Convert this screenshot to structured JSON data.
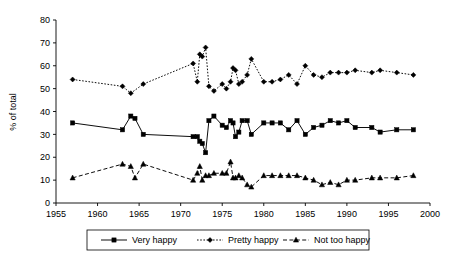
{
  "chart_data": {
    "type": "line",
    "title": "",
    "xlabel": "",
    "ylabel": "% of total",
    "xlim": [
      1955,
      2000
    ],
    "ylim": [
      0,
      80
    ],
    "xticks": [
      1955,
      1960,
      1965,
      1970,
      1975,
      1980,
      1985,
      1990,
      1995,
      2000
    ],
    "yticks": [
      0,
      10,
      20,
      30,
      40,
      50,
      60,
      70,
      80
    ],
    "grid": false,
    "legend_position": "bottom",
    "series": [
      {
        "name": "Very happy",
        "marker": "square",
        "line_style": "solid",
        "color": "#000000",
        "x": [
          1957,
          1963,
          1964,
          1964.5,
          1965.5,
          1971.5,
          1972,
          1972.3,
          1972.6,
          1973,
          1973.4,
          1974,
          1975,
          1975.5,
          1976,
          1976.3,
          1976.6,
          1977,
          1977.4,
          1978,
          1978.5,
          1980,
          1981,
          1982,
          1983,
          1984,
          1985,
          1986,
          1987,
          1988,
          1989,
          1990,
          1991,
          1993,
          1994,
          1996,
          1998
        ],
        "y": [
          35,
          32,
          38,
          37,
          30,
          29,
          29,
          27,
          26,
          22,
          36,
          38,
          34,
          33,
          36,
          35,
          29,
          31,
          36,
          36,
          30,
          35,
          35,
          35,
          32,
          36,
          30,
          33,
          34,
          36,
          35,
          36,
          33,
          33,
          31,
          32,
          32
        ]
      },
      {
        "name": "Pretty happy",
        "marker": "diamond",
        "line_style": "dotted",
        "color": "#000000",
        "x": [
          1957,
          1963,
          1964,
          1965.5,
          1971.5,
          1972,
          1972.3,
          1972.6,
          1973,
          1973.4,
          1974,
          1975,
          1975.5,
          1976,
          1976.3,
          1976.6,
          1977,
          1977.4,
          1978,
          1978.5,
          1980,
          1981,
          1982,
          1983,
          1984,
          1985,
          1986,
          1987,
          1988,
          1989,
          1990,
          1991,
          1993,
          1994,
          1996,
          1998
        ],
        "y": [
          54,
          51,
          48,
          52,
          61,
          53,
          65,
          64,
          68,
          51,
          49,
          52,
          50,
          53,
          59,
          58,
          52,
          53,
          56,
          63,
          53,
          53,
          54,
          56,
          52,
          60,
          56,
          55,
          57,
          57,
          57,
          58,
          57,
          58,
          57,
          56
        ]
      },
      {
        "name": "Not too happy",
        "marker": "triangle",
        "line_style": "dashed",
        "color": "#000000",
        "x": [
          1957,
          1963,
          1964,
          1964.5,
          1965.5,
          1971.5,
          1972,
          1972.3,
          1972.6,
          1973,
          1973.4,
          1974,
          1975,
          1975.5,
          1976,
          1976.3,
          1976.6,
          1977,
          1977.4,
          1978,
          1978.5,
          1980,
          1981,
          1982,
          1983,
          1984,
          1985,
          1986,
          1987,
          1988,
          1989,
          1990,
          1991,
          1993,
          1994,
          1996,
          1998
        ],
        "y": [
          11,
          17,
          16,
          11,
          17,
          10,
          13,
          16,
          10,
          12,
          12,
          13,
          13,
          13,
          18,
          11,
          11,
          12,
          11,
          8,
          7,
          12,
          12,
          12,
          12,
          12,
          11,
          10,
          8,
          9,
          8,
          10,
          10,
          11,
          11,
          11,
          12
        ]
      }
    ]
  },
  "legend": {
    "items": [
      {
        "label": "Very happy"
      },
      {
        "label": "Pretty happy"
      },
      {
        "label": "Not too happy"
      }
    ]
  }
}
